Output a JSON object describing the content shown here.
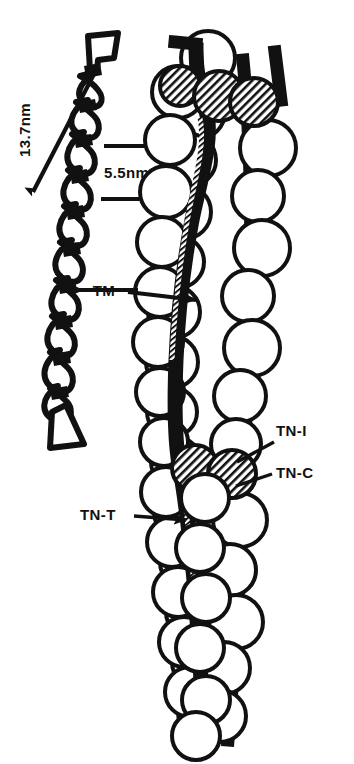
{
  "figure": {
    "type": "scientific-diagram",
    "background_color": "#FFFFFF",
    "ink_color": "#111111",
    "width": 354,
    "height": 764
  },
  "measurements": {
    "helix_period": {
      "value": "13.7nm",
      "orientation": "vertical",
      "arrow": "double-headed-diagonal"
    },
    "scale_bar": {
      "value": "5.5nm",
      "orientation": "horizontal",
      "ticks": 2
    }
  },
  "labels": {
    "tropomyosin": {
      "text": "TM",
      "arrow": "left"
    },
    "troponin_i": {
      "text": "TN-I",
      "arrow": "leader-line"
    },
    "troponin_c": {
      "text": "TN-C",
      "arrow": "leader-line"
    },
    "troponin_t": {
      "text": "TN-T",
      "arrow": "right"
    }
  },
  "legend_keys": [
    {
      "name": "actin-monomer",
      "fill": "white",
      "stroke": "black",
      "shape": "circle"
    },
    {
      "name": "troponin-subunit",
      "fill": "hatched",
      "stroke": "black",
      "shape": "circle"
    },
    {
      "name": "tropomyosin-strand",
      "fill": "black",
      "shape": "ribbon"
    }
  ],
  "components": {
    "left_panel": "tropomyosin coiled-coil helix",
    "right_panel": "actin filament with bound tropomyosin and troponin complexes"
  },
  "counts": {
    "actin_monomers_drawn": 42,
    "troponin_circles_drawn": 5,
    "tropomyosin_strands": 2
  }
}
